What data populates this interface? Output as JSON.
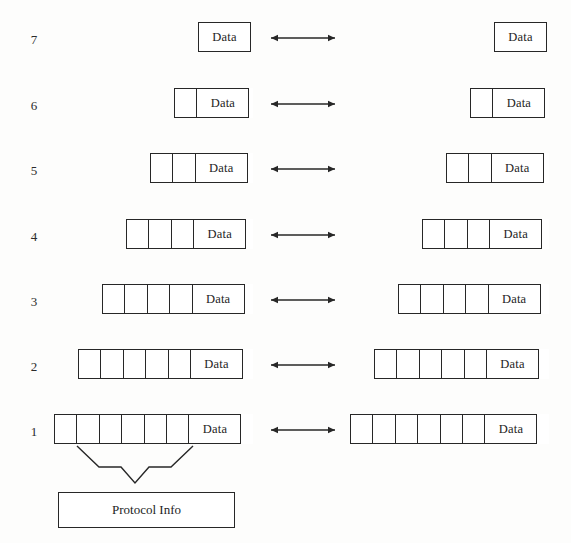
{
  "diagram": {
    "data_label": "Data",
    "protocol_label": "Protocol Info",
    "stroke_color": "#272727",
    "fill_color": "#ffffff",
    "background_color": "#fdfdfc",
    "arrow_label": "peer-to-peer-protocol-arrow",
    "layers": [
      {
        "number": "7",
        "header_cells": 0,
        "row_y": 22,
        "label_y": 33,
        "left_x": 198,
        "right_x": 494
      },
      {
        "number": "6",
        "header_cells": 1,
        "row_y": 88,
        "label_y": 99,
        "left_x": 174,
        "right_x": 470
      },
      {
        "number": "5",
        "header_cells": 2,
        "row_y": 153,
        "label_y": 164,
        "left_x": 150,
        "right_x": 446
      },
      {
        "number": "4",
        "header_cells": 3,
        "row_y": 219,
        "label_y": 230,
        "left_x": 126,
        "right_x": 422
      },
      {
        "number": "3",
        "header_cells": 4,
        "row_y": 284,
        "label_y": 295,
        "left_x": 102,
        "right_x": 398
      },
      {
        "number": "2",
        "header_cells": 5,
        "row_y": 349,
        "label_y": 360,
        "left_x": 78,
        "right_x": 374
      },
      {
        "number": "1",
        "header_cells": 6,
        "row_y": 414,
        "label_y": 425,
        "left_x": 54,
        "right_x": 350
      }
    ],
    "geometry": {
      "cell_width": 24,
      "data_width": 53,
      "row_height": 30,
      "left_number_x": 26,
      "arrow_x": 269,
      "arrow_width": 68,
      "arrow_offset_y": 14,
      "brace_left": 77,
      "brace_right": 193,
      "brace_top": 446,
      "brace_shoulder": 467,
      "brace_tip_x": 135,
      "brace_tip_y": 483,
      "protocol_box": {
        "x": 58,
        "y": 492,
        "w": 177,
        "h": 36
      }
    }
  }
}
